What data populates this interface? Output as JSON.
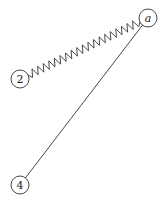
{
  "diagram": {
    "colors": {
      "stroke": "#333333",
      "background": "#ffffff",
      "text": "#222222"
    },
    "nodes": [
      {
        "id": "a",
        "label": "a",
        "italic": true,
        "cx": 148,
        "cy": 18,
        "r": 9
      },
      {
        "id": "2",
        "label": "2",
        "italic": false,
        "cx": 20,
        "cy": 79,
        "r": 9
      },
      {
        "id": "4",
        "label": "4",
        "italic": false,
        "cx": 20,
        "cy": 185,
        "r": 9
      }
    ],
    "edges": [
      {
        "from": "2",
        "to": "a",
        "style": "spring",
        "peaks": 20,
        "amplitude": 4
      },
      {
        "from": "4",
        "to": "a",
        "style": "line"
      }
    ]
  }
}
